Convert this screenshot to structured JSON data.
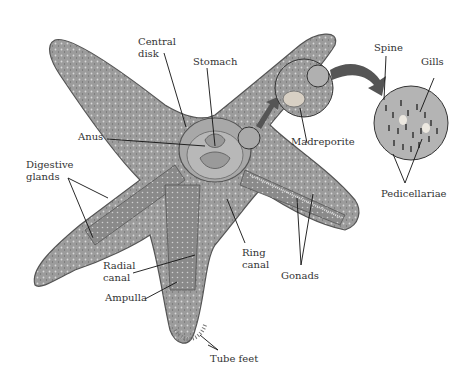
{
  "diagram": {
    "colors": {
      "body": "#9a9a9a",
      "body_dark": "#6a6a6a",
      "body_light": "#c8c8c8",
      "inner": "#8e8e8e",
      "arrow": "#555555",
      "leader": "#111111",
      "text": "#333333"
    },
    "labels": {
      "central_disk": "Central\ndisk",
      "stomach": "Stomach",
      "anus": "Anus",
      "digestive_glands": "Digestive\nglands",
      "madreporite": "Madreporite",
      "spine": "Spine",
      "gills": "Gills",
      "pedicellariae": "Pedicellariae",
      "radial_canal": "Radial\ncanal",
      "ampulla": "Ampulla",
      "ring_canal": "Ring\ncanal",
      "gonads": "Gonads",
      "tube_feet": "Tube feet"
    }
  }
}
